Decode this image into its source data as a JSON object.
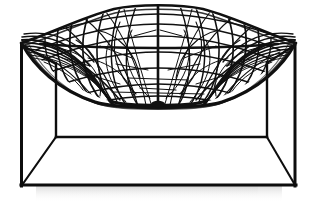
{
  "image": {
    "subject": "designer lounge chair",
    "description": "Black woven organic mesh seat shell on a minimal square tube frame",
    "background_color": "#ffffff",
    "frame_color": "#0d0d0d",
    "mesh_color": "#111111",
    "shadow_color": "#d8d8d8",
    "width": 317,
    "height": 204,
    "view": "front elevation, slight high angle"
  },
  "geometry": {
    "frame": {
      "front_top_left": [
        20,
        44
      ],
      "front_top_right": [
        295,
        44
      ],
      "front_bottom_left": [
        22,
        185
      ],
      "front_bottom_right": [
        295,
        185
      ],
      "back_top_left": [
        56,
        63
      ],
      "back_top_right": [
        267,
        63
      ],
      "back_bottom_left": [
        56,
        137
      ],
      "back_bottom_right": [
        267,
        137
      ],
      "tube_thickness_px": 3
    },
    "seat_shell": {
      "peak_y": 7,
      "lowest_dip_y": 106,
      "left_wing_x": 22,
      "right_wing_x": 296,
      "center_x": 158,
      "center_spine": true,
      "horizontal_band_y": 44
    },
    "floor_reflection": {
      "top_y": 186,
      "height_px": 16,
      "opacity": 0.2
    }
  }
}
